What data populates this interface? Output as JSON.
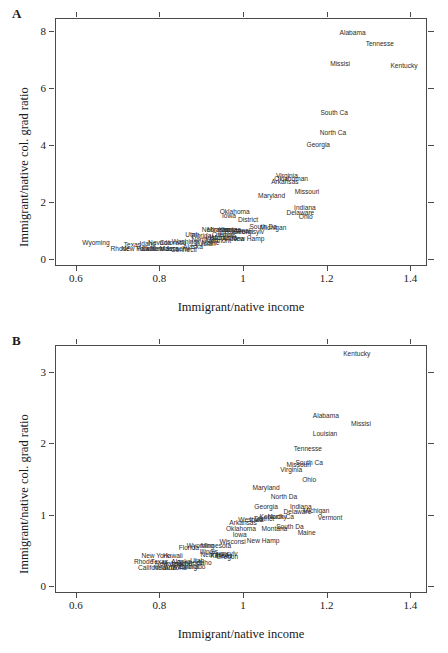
{
  "figure": {
    "xlabel": "Immigrant/native income",
    "ylabel": "Immigrant/native col. grad ratio",
    "panel_a_letter": "A",
    "panel_b_letter": "B"
  },
  "chart_data": [
    {
      "type": "scatter",
      "panel": "A",
      "title": "",
      "xlabel": "Immigrant/native income",
      "ylabel": "Immigrant/native col. grad ratio",
      "xlim": [
        0.55,
        1.44
      ],
      "ylim": [
        -0.25,
        8.45
      ],
      "xticks": [
        0.6,
        0.8,
        1,
        1.2,
        1.4
      ],
      "xticklabels": [
        "0.6",
        "0.8",
        "1",
        "1.2",
        "1.4"
      ],
      "yticks": [
        0,
        2,
        4,
        6,
        8
      ],
      "yticklabels": [
        "0",
        "2",
        "4",
        "6",
        "8"
      ],
      "grid": false,
      "legend": "none",
      "marker": "text-label",
      "points": [
        {
          "label": "Alabama",
          "x": 1.262,
          "y": 7.92
        },
        {
          "label": "Tennesse",
          "x": 1.327,
          "y": 7.53
        },
        {
          "label": "Missisi",
          "x": 1.232,
          "y": 6.83
        },
        {
          "label": "Kentucky",
          "x": 1.385,
          "y": 6.78
        },
        {
          "label": "South Ca",
          "x": 1.218,
          "y": 5.13
        },
        {
          "label": "North Ca",
          "x": 1.215,
          "y": 4.42
        },
        {
          "label": "Georgia",
          "x": 1.18,
          "y": 4.01
        },
        {
          "label": "Virginia",
          "x": 1.105,
          "y": 2.92
        },
        {
          "label": "Oklahoman",
          "x": 1.115,
          "y": 2.8
        },
        {
          "label": "Arkansas",
          "x": 1.1,
          "y": 2.68
        },
        {
          "label": "Missouri",
          "x": 1.153,
          "y": 2.36
        },
        {
          "label": "Maryland",
          "x": 1.068,
          "y": 2.2
        },
        {
          "label": "Indiana",
          "x": 1.148,
          "y": 1.8
        },
        {
          "label": "Delaware",
          "x": 1.137,
          "y": 1.62
        },
        {
          "label": "Ohio",
          "x": 1.15,
          "y": 1.47
        },
        {
          "label": "Oklahoma",
          "x": 0.98,
          "y": 1.66
        },
        {
          "label": "Iowa",
          "x": 0.966,
          "y": 1.52
        },
        {
          "label": "District",
          "x": 1.012,
          "y": 1.35
        },
        {
          "label": "South Da",
          "x": 1.048,
          "y": 1.11
        },
        {
          "label": "Michigan",
          "x": 1.072,
          "y": 1.07
        },
        {
          "label": "Nebraska",
          "x": 0.935,
          "y": 1.02
        },
        {
          "label": "Minnesota",
          "x": 0.95,
          "y": 1.0
        },
        {
          "label": "Kansas",
          "x": 0.968,
          "y": 1.03
        },
        {
          "label": "Wisconsi",
          "x": 0.985,
          "y": 0.98
        },
        {
          "label": "Georgi",
          "x": 1.0,
          "y": 0.96
        },
        {
          "label": "Pennsylv",
          "x": 1.018,
          "y": 0.94
        },
        {
          "label": "Utah",
          "x": 0.878,
          "y": 0.82
        },
        {
          "label": "Florida",
          "x": 0.9,
          "y": 0.8
        },
        {
          "label": "Oregon",
          "x": 0.952,
          "y": 0.85
        },
        {
          "label": "Illinois",
          "x": 0.962,
          "y": 0.82
        },
        {
          "label": "Idaho",
          "x": 0.93,
          "y": 0.74
        },
        {
          "label": "Montana",
          "x": 0.955,
          "y": 0.72
        },
        {
          "label": "Arizona",
          "x": 0.976,
          "y": 0.7
        },
        {
          "label": "New Hamp",
          "x": 1.012,
          "y": 0.68
        },
        {
          "label": "Wyoming",
          "x": 0.648,
          "y": 0.54
        },
        {
          "label": "Texas",
          "x": 0.735,
          "y": 0.5
        },
        {
          "label": "Idaho2",
          "x": 0.772,
          "y": 0.52
        },
        {
          "label": "Nevada",
          "x": 0.8,
          "y": 0.54
        },
        {
          "label": "Colorado",
          "x": 0.832,
          "y": 0.56
        },
        {
          "label": "Washingt",
          "x": 0.862,
          "y": 0.58
        },
        {
          "label": "Rhode",
          "x": 0.706,
          "y": 0.36
        },
        {
          "label": "New York",
          "x": 0.742,
          "y": 0.34
        },
        {
          "label": "Hawaii",
          "x": 0.768,
          "y": 0.34
        },
        {
          "label": "California",
          "x": 0.79,
          "y": 0.33
        },
        {
          "label": "New Jers",
          "x": 0.812,
          "y": 0.33
        },
        {
          "label": "Connecti",
          "x": 0.858,
          "y": 0.32
        },
        {
          "label": "Massachu",
          "x": 0.836,
          "y": 0.34
        },
        {
          "label": "Alaska",
          "x": 0.88,
          "y": 0.4
        },
        {
          "label": "Louisian",
          "x": 0.905,
          "y": 0.52
        },
        {
          "label": "Maine",
          "x": 0.922,
          "y": 0.57
        },
        {
          "label": "Vermont",
          "x": 0.942,
          "y": 0.62
        },
        {
          "label": "North Da",
          "x": 0.908,
          "y": 0.66
        }
      ]
    },
    {
      "type": "scatter",
      "panel": "B",
      "title": "",
      "xlabel": "Immigrant/native income",
      "ylabel": "Immigrant/native col. grad ratio",
      "xlim": [
        0.55,
        1.44
      ],
      "ylim": [
        -0.1,
        3.38
      ],
      "xticks": [
        0.6,
        0.8,
        1,
        1.2,
        1.4
      ],
      "xticklabels": [
        "0.6",
        "0.8",
        "1",
        "1.2",
        "1.4"
      ],
      "yticks": [
        0,
        1,
        2,
        3
      ],
      "yticklabels": [
        "0",
        "1",
        "2",
        "3"
      ],
      "grid": false,
      "legend": "none",
      "marker": "text-label",
      "points": [
        {
          "label": "Kentucky",
          "x": 1.272,
          "y": 3.26
        },
        {
          "label": "Alabama",
          "x": 1.198,
          "y": 2.39
        },
        {
          "label": "Missisi",
          "x": 1.282,
          "y": 2.27
        },
        {
          "label": "Louisian",
          "x": 1.196,
          "y": 2.13
        },
        {
          "label": "Tennesse",
          "x": 1.155,
          "y": 1.92
        },
        {
          "label": "South Ca",
          "x": 1.158,
          "y": 1.72
        },
        {
          "label": "Missouri",
          "x": 1.133,
          "y": 1.7
        },
        {
          "label": "Virginia",
          "x": 1.115,
          "y": 1.63
        },
        {
          "label": "Ohio",
          "x": 1.158,
          "y": 1.48
        },
        {
          "label": "Maryland",
          "x": 1.055,
          "y": 1.38
        },
        {
          "label": "North Da",
          "x": 1.098,
          "y": 1.25
        },
        {
          "label": "Georgia",
          "x": 1.055,
          "y": 1.1
        },
        {
          "label": "Indiana",
          "x": 1.138,
          "y": 1.11
        },
        {
          "label": "Michigan",
          "x": 1.175,
          "y": 1.05
        },
        {
          "label": "Delaware",
          "x": 1.13,
          "y": 1.04
        },
        {
          "label": "Vermont",
          "x": 1.208,
          "y": 0.95
        },
        {
          "label": "North Ca",
          "x": 1.09,
          "y": 0.96
        },
        {
          "label": "Kentucky2",
          "x": 1.072,
          "y": 0.96
        },
        {
          "label": "District",
          "x": 1.05,
          "y": 0.94
        },
        {
          "label": "Iowa2",
          "x": 1.032,
          "y": 0.93
        },
        {
          "label": "Arkansas",
          "x": 1.0,
          "y": 0.88
        },
        {
          "label": "Oklahoma",
          "x": 0.995,
          "y": 0.8
        },
        {
          "label": "Montana",
          "x": 1.075,
          "y": 0.8
        },
        {
          "label": "South Da",
          "x": 1.112,
          "y": 0.83
        },
        {
          "label": "Maine",
          "x": 1.152,
          "y": 0.74
        },
        {
          "label": "Iowa",
          "x": 0.992,
          "y": 0.71
        },
        {
          "label": "New Hamp",
          "x": 1.048,
          "y": 0.63
        },
        {
          "label": "Wisconsi",
          "x": 0.975,
          "y": 0.62
        },
        {
          "label": "Wyoming",
          "x": 0.898,
          "y": 0.56
        },
        {
          "label": "Minnesota",
          "x": 0.935,
          "y": 0.56
        },
        {
          "label": "Florida",
          "x": 0.87,
          "y": 0.53
        },
        {
          "label": "Illinois",
          "x": 0.918,
          "y": 0.47
        },
        {
          "label": "Nebraska",
          "x": 0.932,
          "y": 0.43
        },
        {
          "label": "Kansas",
          "x": 0.948,
          "y": 0.42
        },
        {
          "label": "Oregon",
          "x": 0.962,
          "y": 0.4
        },
        {
          "label": "New York",
          "x": 0.79,
          "y": 0.42
        },
        {
          "label": "Hawaii",
          "x": 0.832,
          "y": 0.42
        },
        {
          "label": "Rhode",
          "x": 0.762,
          "y": 0.34
        },
        {
          "label": "Texas",
          "x": 0.8,
          "y": 0.33
        },
        {
          "label": "Alaska",
          "x": 0.852,
          "y": 0.34
        },
        {
          "label": "California",
          "x": 0.782,
          "y": 0.25
        },
        {
          "label": "Colorado",
          "x": 0.878,
          "y": 0.26
        },
        {
          "label": "Arizona",
          "x": 0.838,
          "y": 0.25
        },
        {
          "label": "Nevada",
          "x": 0.812,
          "y": 0.25
        },
        {
          "label": "Washingt",
          "x": 0.862,
          "y": 0.26
        },
        {
          "label": "Utah",
          "x": 0.89,
          "y": 0.35
        },
        {
          "label": "Idaho",
          "x": 0.905,
          "y": 0.32
        },
        {
          "label": "New Jers",
          "x": 0.822,
          "y": 0.3
        },
        {
          "label": "Massachu",
          "x": 0.842,
          "y": 0.3
        },
        {
          "label": "Connecti",
          "x": 0.872,
          "y": 0.32
        },
        {
          "label": "Pennsylv",
          "x": 0.955,
          "y": 0.45
        },
        {
          "label": "West Vir",
          "x": 1.018,
          "y": 0.92
        }
      ]
    }
  ]
}
